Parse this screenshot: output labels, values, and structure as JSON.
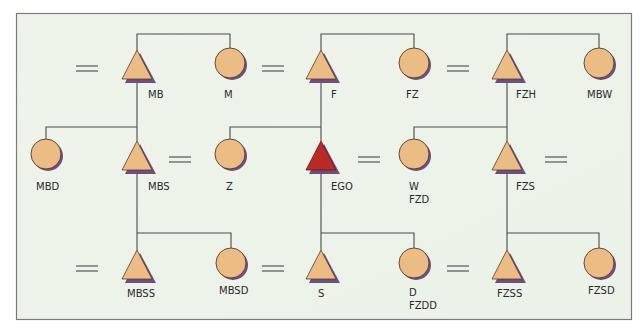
{
  "diagram": {
    "type": "kinship-chart",
    "colors": {
      "background": "#eef3ea",
      "frame": "#7a7a7a",
      "line": "#4a4a4a",
      "node_fill": "#ecbc85",
      "node_stroke": "#5a3a2a",
      "ego_fill": "#b82a26",
      "shadow": "#6c4f80"
    },
    "nodes": [
      {
        "id": "MB",
        "shape": "triangle",
        "x": 137,
        "y": 65,
        "labels": [
          "MB"
        ]
      },
      {
        "id": "M",
        "shape": "circle",
        "x": 230,
        "y": 63,
        "labels": [
          "M"
        ]
      },
      {
        "id": "F",
        "shape": "triangle",
        "x": 321,
        "y": 65,
        "labels": [
          "F"
        ]
      },
      {
        "id": "FZ",
        "shape": "circle",
        "x": 414,
        "y": 63,
        "labels": [
          "FZ"
        ]
      },
      {
        "id": "FZH",
        "shape": "triangle",
        "x": 507,
        "y": 65,
        "labels": [
          "FZH"
        ]
      },
      {
        "id": "MBW",
        "shape": "circle",
        "x": 599,
        "y": 63,
        "labels": [
          "MBW"
        ]
      },
      {
        "id": "MBD",
        "shape": "circle",
        "x": 46,
        "y": 154,
        "labels": [
          "MBD"
        ]
      },
      {
        "id": "MBS",
        "shape": "triangle",
        "x": 137,
        "y": 156,
        "labels": [
          "MBS"
        ]
      },
      {
        "id": "Z",
        "shape": "circle",
        "x": 230,
        "y": 154,
        "labels": [
          "Z"
        ]
      },
      {
        "id": "EGO",
        "shape": "triangle",
        "x": 321,
        "y": 156,
        "labels": [
          "EGO"
        ],
        "ego": true
      },
      {
        "id": "W",
        "shape": "circle",
        "x": 414,
        "y": 154,
        "labels": [
          "W",
          "FZD"
        ]
      },
      {
        "id": "FZS",
        "shape": "triangle",
        "x": 507,
        "y": 156,
        "labels": [
          "FZS"
        ]
      },
      {
        "id": "MBSS",
        "shape": "triangle",
        "x": 137,
        "y": 265,
        "labels": [
          "MBSS"
        ]
      },
      {
        "id": "MBSD",
        "shape": "circle",
        "x": 231,
        "y": 263,
        "labels": [
          "MBSD"
        ]
      },
      {
        "id": "S",
        "shape": "triangle",
        "x": 321,
        "y": 265,
        "labels": [
          "S"
        ]
      },
      {
        "id": "D",
        "shape": "circle",
        "x": 414,
        "y": 263,
        "labels": [
          "D",
          "FZDD"
        ]
      },
      {
        "id": "FZSS",
        "shape": "triangle",
        "x": 507,
        "y": 265,
        "labels": [
          "FZSS"
        ]
      },
      {
        "id": "FZSD",
        "shape": "circle",
        "x": 599,
        "y": 263,
        "labels": [
          "FZSD"
        ]
      }
    ],
    "marriages": [
      {
        "between": [
          "?",
          "MB"
        ],
        "x": 87,
        "y": 68
      },
      {
        "between": [
          "M",
          "F"
        ],
        "x": 271,
        "y": 68
      },
      {
        "between": [
          "FZ",
          "FZH"
        ],
        "x": 457,
        "y": 68
      },
      {
        "between": [
          "MBS",
          "Z"
        ],
        "x": 181,
        "y": 160
      },
      {
        "between": [
          "EGO",
          "W"
        ],
        "x": 367,
        "y": 160
      },
      {
        "between": [
          "FZS",
          "?"
        ],
        "x": 553,
        "y": 160
      },
      {
        "between": [
          "?",
          "MBSS"
        ],
        "x": 87,
        "y": 269
      },
      {
        "between": [
          "MBSD",
          "S"
        ],
        "x": 271,
        "y": 269
      },
      {
        "between": [
          "D",
          "FZSS"
        ],
        "x": 457,
        "y": 269
      }
    ],
    "sibling_sets": [
      {
        "parent_line_from": "top",
        "members": [
          "MB",
          "M"
        ]
      },
      {
        "parent_line_from": "top",
        "members": [
          "F",
          "FZ"
        ]
      },
      {
        "parent_line_from": "top",
        "members": [
          "FZH",
          "MBW"
        ]
      },
      {
        "parent_line_from": "MB",
        "members": [
          "MBD",
          "MBS"
        ]
      },
      {
        "parent_line_from": "F",
        "members": [
          "Z",
          "EGO"
        ]
      },
      {
        "parent_line_from": "FZH",
        "members": [
          "W",
          "FZS"
        ]
      },
      {
        "parent_line_from": "MBS",
        "members": [
          "MBSS",
          "MBSD"
        ]
      },
      {
        "parent_line_from": "EGO",
        "members": [
          "S",
          "D"
        ]
      },
      {
        "parent_line_from": "FZS",
        "members": [
          "FZSS",
          "FZSD"
        ]
      }
    ]
  },
  "labels": {
    "MB": "MB",
    "M": "M",
    "F": "F",
    "FZ": "FZ",
    "FZH": "FZH",
    "MBW": "MBW",
    "MBD": "MBD",
    "MBS": "MBS",
    "Z": "Z",
    "EGO": "EGO",
    "W": "W",
    "FZD": "FZD",
    "FZS": "FZS",
    "MBSS": "MBSS",
    "MBSD": "MBSD",
    "S": "S",
    "D": "D",
    "FZDD": "FZDD",
    "FZSS": "FZSS",
    "FZSD": "FZSD"
  }
}
